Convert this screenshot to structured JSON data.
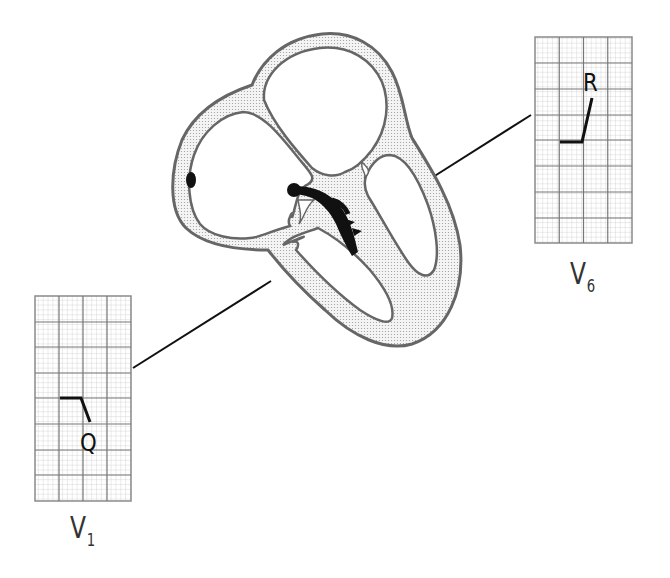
{
  "diagram": {
    "leads": [
      {
        "id": "v1",
        "label_main": "V",
        "label_sub": "1",
        "wave_label": "Q",
        "position": "left-lower"
      },
      {
        "id": "v6",
        "label_main": "V",
        "label_sub": "6",
        "wave_label": "R",
        "position": "right-upper"
      }
    ],
    "colors": {
      "grid_minor": "#b8b8b8",
      "grid_major": "#7a7a7a",
      "outline": "#6a6a6a",
      "muscle_fill": "#e9e9e9",
      "ink": "#111111"
    }
  }
}
